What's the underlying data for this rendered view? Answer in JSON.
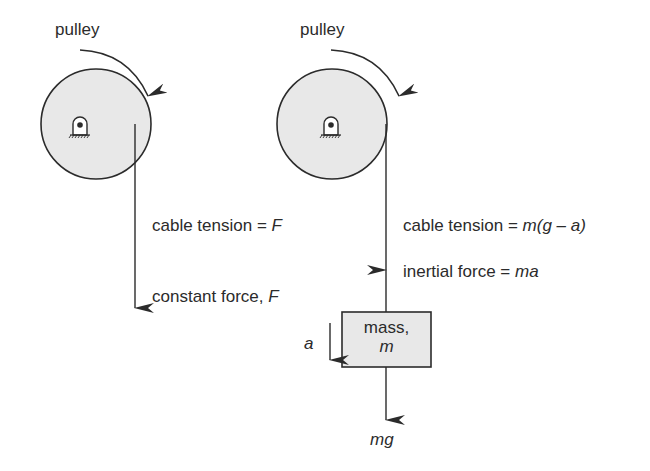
{
  "colors": {
    "stroke": "#2b2b2b",
    "fill": "#e8e8e8",
    "background": "#ffffff"
  },
  "left_diagram": {
    "pulley_label": "pulley",
    "rotation_arrow": "clockwise-arrow",
    "tension_label_prefix": "cable tension = ",
    "tension_label_var": "F",
    "force_label_prefix": "constant force, ",
    "force_label_var": "F"
  },
  "right_diagram": {
    "pulley_label": "pulley",
    "rotation_arrow": "clockwise-arrow",
    "tension_label_prefix": "cable tension = ",
    "tension_label_expr": "m(g – a)",
    "inertial_label_prefix": "inertial force = ",
    "inertial_label_expr": "ma",
    "mass_box_line1": "mass,",
    "mass_box_line2": "m",
    "acceleration_label": "a",
    "weight_label": "mg"
  }
}
